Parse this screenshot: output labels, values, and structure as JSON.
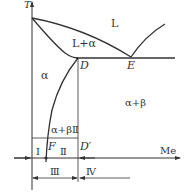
{
  "diagram": {
    "type": "binary-phase-diagram",
    "axes": {
      "y_label": "T",
      "x_label": "Me"
    },
    "regions": {
      "liquid": "L",
      "liquid_alpha": "L+α",
      "alpha": "α",
      "alpha_beta": "α+β",
      "alpha_beta_II": "α+βⅡ"
    },
    "points": {
      "D": "D",
      "E": "E",
      "F": "F",
      "D_prime": "D′"
    },
    "zones": {
      "I": "Ⅰ",
      "II": "Ⅱ",
      "III": "Ⅲ",
      "IV": "Ⅳ"
    },
    "colors": {
      "line": "#333333",
      "text": "#333333",
      "background": "#ffffff"
    }
  }
}
